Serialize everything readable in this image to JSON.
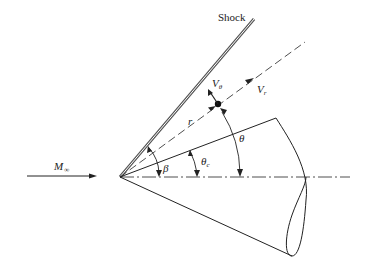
{
  "diagram": {
    "labels": {
      "shock": "Shock",
      "freestream": "M",
      "freestream_sub": "∞",
      "v_theta": "V",
      "v_theta_sub": "θ",
      "v_r": "V",
      "v_r_sub": "r",
      "r": "r",
      "theta": "θ",
      "theta_c": "θ",
      "theta_c_sub": "c",
      "beta": "β"
    },
    "colors": {
      "line": "#222222",
      "shock": "#777777",
      "background": "#ffffff"
    }
  }
}
